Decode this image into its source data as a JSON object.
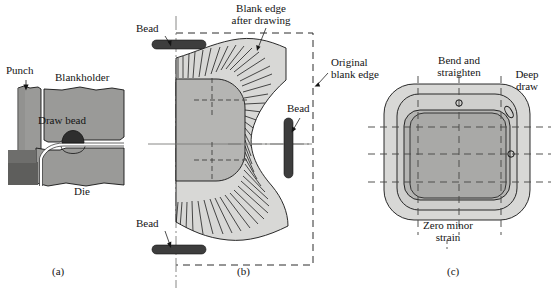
{
  "figure": {
    "type": "technical-diagram",
    "background_color": "#ffffff",
    "line_color": "#141414"
  },
  "palette": {
    "light_gray": "#d8d8d6",
    "mid_gray": "#b5b5b3",
    "dark_gray": "#9a9a98",
    "darker_gray": "#6e6e6c",
    "bead_dark": "#3d3d3d",
    "outline": "#141414",
    "white": "#ffffff"
  },
  "panels": [
    {
      "id": "a",
      "caption": "(a)",
      "caption_x": 60,
      "caption_y": 272,
      "description": "Cross-section of punch, blankholder, die and draw bead",
      "labels": [
        {
          "name": "punch-label",
          "text": "Punch",
          "x": 6,
          "y": 71,
          "align": "left"
        },
        {
          "name": "blankholder-label",
          "text": "Blankholder",
          "x": 55,
          "y": 78,
          "align": "left"
        },
        {
          "name": "draw-bead-label",
          "text": "Draw bead",
          "x": 38,
          "y": 121,
          "align": "left"
        },
        {
          "name": "die-label",
          "text": "Die",
          "x": 74,
          "y": 189,
          "align": "left"
        }
      ]
    },
    {
      "id": "b",
      "caption": "(b)",
      "caption_x": 245,
      "caption_y": 272,
      "description": "Plan view of blank showing original blank edge, blank edge after drawing, and bead positions",
      "labels": [
        {
          "name": "blank-edge-after-drawing-label",
          "text": "Blank edge\nafter drawing",
          "x": 260,
          "y": 4,
          "align": "center"
        },
        {
          "name": "original-blank-edge-label",
          "text": "Original\nblank edge",
          "x": 332,
          "y": 64,
          "align": "left"
        },
        {
          "name": "bead-label-top",
          "text": "Bead",
          "x": 139,
          "y": 27,
          "align": "left"
        },
        {
          "name": "bead-label-right",
          "text": "Bead",
          "x": 285,
          "y": 105,
          "align": "left"
        },
        {
          "name": "bead-label-bottom",
          "text": "Bead",
          "x": 139,
          "y": 222,
          "align": "left"
        }
      ]
    },
    {
      "id": "c",
      "caption": "(c)",
      "caption_x": 455,
      "caption_y": 272,
      "description": "Plan view of drawn part showing deformation zones with grid circles",
      "labels": [
        {
          "name": "bend-and-straighten-label",
          "text": "Bend and\nstraighten",
          "x": 440,
          "y": 59,
          "align": "center"
        },
        {
          "name": "deep-draw-label",
          "text": "Deep\ndraw",
          "x": 525,
          "y": 73,
          "align": "center"
        },
        {
          "name": "zero-minor-strain-label",
          "text": "Zero minor\nstrain",
          "x": 447,
          "y": 222,
          "align": "center"
        }
      ],
      "grid_circles": [
        {
          "name": "circle-undeformed-top",
          "cx": 459,
          "cy": 103,
          "rx": 3.2,
          "ry": 3.2,
          "rot": 0,
          "zone": "bend-and-straighten"
        },
        {
          "name": "ellipse-deep-draw",
          "cx": 509,
          "cy": 112,
          "rx": 3.0,
          "ry": 6.4,
          "rot": -32,
          "zone": "deep-draw"
        },
        {
          "name": "circle-undeformed-side",
          "cx": 511,
          "cy": 154,
          "rx": 3.2,
          "ry": 3.2,
          "rot": 0,
          "zone": "flange"
        }
      ]
    }
  ]
}
